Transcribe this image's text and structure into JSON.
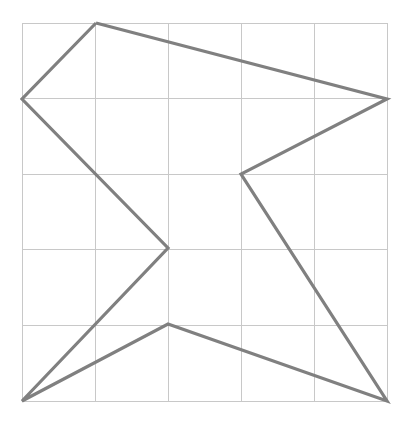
{
  "figure": {
    "canvas": {
      "width": 406,
      "height": 428,
      "background": "#ffffff"
    },
    "grid": {
      "visible": true,
      "x_min": 22,
      "x_max": 387,
      "y_min": 23,
      "y_max": 401,
      "columns": 5,
      "rows": 5,
      "cell_width": 73,
      "cell_height": 75.6,
      "x_lines": [
        22,
        95,
        168,
        241,
        314,
        387
      ],
      "y_lines": [
        23,
        98.6,
        174.2,
        249.8,
        325.4,
        401
      ],
      "color": "#c8c8c8",
      "stroke_width": 1
    },
    "polygon": {
      "closed": true,
      "stroke_color": "#808080",
      "stroke_width": 3.2,
      "fill": "none",
      "line_join": "miter",
      "vertex_count": 8,
      "vertices": [
        {
          "name": "top-peak",
          "x": 96,
          "y": 23
        },
        {
          "name": "right-upper",
          "x": 387,
          "y": 99
        },
        {
          "name": "right-middle-notch",
          "x": 241,
          "y": 174
        },
        {
          "name": "bottom-right",
          "x": 387,
          "y": 401
        },
        {
          "name": "bottom-middle-peak",
          "x": 168,
          "y": 324
        },
        {
          "name": "bottom-left",
          "x": 22,
          "y": 401
        },
        {
          "name": "center-notch",
          "x": 168,
          "y": 248
        },
        {
          "name": "left-middle",
          "x": 22,
          "y": 99
        }
      ],
      "points_attr": "96,23 387,99 241,174 387,401 168,324 22,401 168,248 22,99"
    }
  },
  "chart_data": {
    "type": "line",
    "xlabel": "",
    "ylabel": "",
    "xlim": [
      22,
      387
    ],
    "ylim": [
      23,
      401
    ],
    "grid": true,
    "legend": "none",
    "series": [
      {
        "name": "polygon-outline",
        "closed": true,
        "color": "#808080",
        "x": [
          96,
          387,
          241,
          387,
          168,
          22,
          168,
          22,
          96
        ],
        "y": [
          23,
          99,
          174,
          401,
          324,
          401,
          248,
          99,
          23
        ]
      }
    ],
    "xticks": [
      22,
      95,
      168,
      241,
      314,
      387
    ],
    "yticks": [
      23,
      99,
      174,
      250,
      325,
      401
    ],
    "xticklabels": [
      "",
      "",
      "",
      "",
      "",
      ""
    ],
    "yticklabels": [
      "",
      "",
      "",
      "",
      "",
      ""
    ],
    "annotations": []
  }
}
